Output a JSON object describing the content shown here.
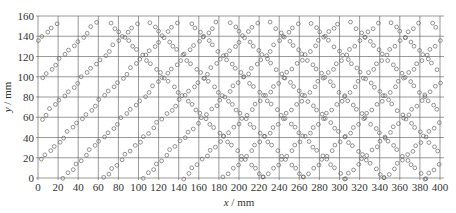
{
  "chart_data": {
    "type": "scatter",
    "title": "",
    "xlabel": "x / mm",
    "ylabel": "y / mm",
    "xlabel_var": "x",
    "ylabel_var": "y",
    "unit": "mm",
    "xlim": [
      0,
      400
    ],
    "ylim": [
      0,
      160
    ],
    "xticks": [
      0,
      20,
      40,
      60,
      80,
      100,
      120,
      140,
      160,
      180,
      200,
      220,
      240,
      260,
      280,
      300,
      320,
      340,
      360,
      380,
      400
    ],
    "yticks": [
      0,
      20,
      40,
      60,
      80,
      100,
      120,
      140,
      160
    ],
    "grid": true,
    "legend": null,
    "marker": "open-circle",
    "pattern": {
      "period_x": 40,
      "period_y": 40,
      "diagonal_step": 4.5,
      "cluster_centers_offset": [
        [
          0,
          20
        ],
        [
          20,
          0
        ],
        [
          20,
          40
        ],
        [
          40,
          20
        ]
      ],
      "x_range": [
        0,
        400
      ],
      "y_range": [
        0,
        155
      ]
    }
  },
  "colors": {
    "grid": "#555555",
    "marker": "#666666",
    "text": "#333333",
    "background": "#ffffff"
  }
}
